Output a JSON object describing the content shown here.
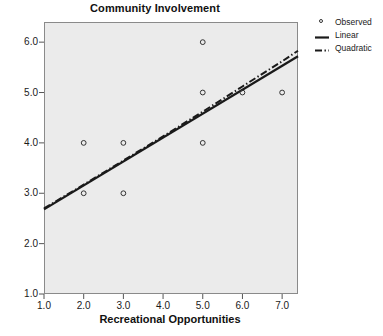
{
  "chart_data": {
    "type": "scatter",
    "title": "Community Involvement",
    "xlabel": "Recreational Opportunities",
    "ylabel": "",
    "xlim": [
      1.0,
      7.4
    ],
    "ylim": [
      1.0,
      6.4
    ],
    "xticks": [
      "1.0",
      "2.0",
      "3.0",
      "4.0",
      "5.0",
      "6.0",
      "7.0"
    ],
    "xtick_values": [
      1.0,
      2.0,
      3.0,
      4.0,
      5.0,
      6.0,
      7.0
    ],
    "yticks": [
      "1.0",
      "2.0",
      "3.0",
      "4.0",
      "5.0",
      "6.0"
    ],
    "ytick_values": [
      1.0,
      2.0,
      3.0,
      4.0,
      5.0,
      6.0
    ],
    "grid": false,
    "legend_position": "right",
    "plot_background": "#ebebeb",
    "frame_color": "#8a8a8a",
    "series": [
      {
        "name": "Observed",
        "type": "scatter",
        "marker": "open-circle",
        "color": "#333333",
        "points": [
          {
            "x": 2.0,
            "y": 4.0
          },
          {
            "x": 2.0,
            "y": 3.0
          },
          {
            "x": 3.0,
            "y": 4.0
          },
          {
            "x": 3.0,
            "y": 3.0
          },
          {
            "x": 5.0,
            "y": 6.0
          },
          {
            "x": 5.0,
            "y": 5.0
          },
          {
            "x": 5.0,
            "y": 4.0
          },
          {
            "x": 6.0,
            "y": 5.0
          },
          {
            "x": 7.0,
            "y": 5.0
          }
        ]
      },
      {
        "name": "Linear",
        "type": "line",
        "style": "solid",
        "color": "#1a1a1a",
        "x": [
          1.0,
          7.4
        ],
        "y": [
          2.68,
          5.72
        ]
      },
      {
        "name": "Quadratic",
        "type": "line",
        "style": "dash-dot",
        "color": "#1a1a1a",
        "x": [
          1.0,
          2.0,
          3.0,
          4.0,
          5.0,
          6.0,
          7.0,
          7.4
        ],
        "y": [
          2.7,
          3.17,
          3.65,
          4.13,
          4.62,
          5.12,
          5.62,
          5.83
        ]
      }
    ]
  },
  "legend": {
    "entries": [
      {
        "label": "Observed",
        "key": "open-circle"
      },
      {
        "label": "Linear",
        "key": "solid-line"
      },
      {
        "label": "Quadratic",
        "key": "dash-dot-line"
      }
    ]
  }
}
